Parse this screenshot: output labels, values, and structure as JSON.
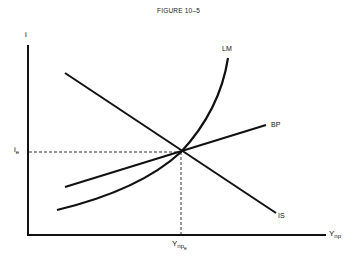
{
  "figure": {
    "title": "FIGURE 10–5"
  },
  "axes": {
    "y_label": "i",
    "x_label_main": "Y",
    "x_label_sub": "np"
  },
  "equilibrium": {
    "i_label_main": "i",
    "i_label_sub": "e",
    "y_label_main": "Y",
    "y_label_sub": "np",
    "y_label_subsub": "e"
  },
  "curves": {
    "lm": "LM",
    "bp": "BP",
    "is": "IS"
  },
  "colors": {
    "line": "#111111",
    "background": "#ffffff"
  }
}
